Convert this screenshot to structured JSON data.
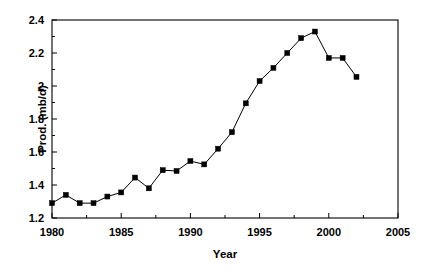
{
  "chart_data": {
    "type": "line",
    "title": "",
    "xlabel": "Year",
    "ylabel": "Prod. (mb/d)",
    "xlim": [
      1980,
      2005
    ],
    "ylim": [
      1.2,
      2.4
    ],
    "grid": false,
    "legend": "none",
    "marker": "filled-square",
    "line_color": "#000000",
    "marker_color": "#000000",
    "x_major_ticks": [
      1980,
      1985,
      1990,
      1995,
      2000,
      2005
    ],
    "x_minor_ticks": [
      1982.5,
      1987.5,
      1992.5,
      1997.5,
      2002.5
    ],
    "x_tick_labels": [
      "1980",
      "1985",
      "1990",
      "1995",
      "2000",
      "2005"
    ],
    "y_major_ticks": [
      1.2,
      1.4,
      1.6,
      1.8,
      2.0,
      2.2,
      2.4
    ],
    "y_minor_ticks": [
      1.3,
      1.5,
      1.7,
      1.9,
      2.1,
      2.3
    ],
    "y_tick_labels": [
      "1.2",
      "1.4",
      "1.6",
      "1.8",
      "2",
      "2.2",
      "2.4"
    ],
    "x": [
      1980,
      1981,
      1982,
      1983,
      1984,
      1985,
      1986,
      1987,
      1988,
      1989,
      1990,
      1991,
      1992,
      1993,
      1994,
      1995,
      1996,
      1997,
      1998,
      1999,
      2000,
      2001,
      2002
    ],
    "values": [
      1.29,
      1.34,
      1.29,
      1.29,
      1.33,
      1.355,
      1.445,
      1.38,
      1.49,
      1.485,
      1.545,
      1.525,
      1.62,
      1.72,
      1.895,
      2.03,
      2.11,
      2.2,
      2.29,
      2.33,
      2.17,
      2.17,
      2.055
    ],
    "series": [
      {
        "name": "Prod. (mb/d)",
        "values": [
          1.29,
          1.34,
          1.29,
          1.29,
          1.33,
          1.355,
          1.445,
          1.38,
          1.49,
          1.485,
          1.545,
          1.525,
          1.62,
          1.72,
          1.895,
          2.03,
          2.11,
          2.2,
          2.29,
          2.33,
          2.17,
          2.17,
          2.055
        ]
      }
    ]
  }
}
